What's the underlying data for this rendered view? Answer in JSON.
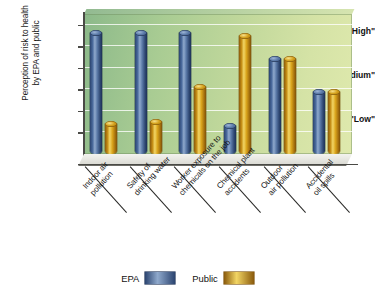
{
  "chart_data": {
    "type": "bar",
    "title": "",
    "xlabel": "",
    "ylabel": "Perception of risk to health by EPA and public",
    "ylabel_line1": "Perception of risk to health",
    "ylabel_line2": "by EPA and public",
    "categories": [
      "Indoor air pollution",
      "Safety of drinking water",
      "Worker exposure to chemicals on the job",
      "Chemical plant accidents",
      "Outdoor air pollution",
      "Accidental oil spills"
    ],
    "category_lines": [
      [
        "Indoor air",
        "pollution"
      ],
      [
        "Safety of",
        "drinking water"
      ],
      [
        "Worker exposure to",
        "chemicals on the job"
      ],
      [
        "Chemical plant",
        "accidents"
      ],
      [
        "Outdoor",
        "air pollution"
      ],
      [
        "Accidental",
        "oil spills"
      ]
    ],
    "series": [
      {
        "name": "EPA",
        "color": "#3c5c8c",
        "values": [
          2.8,
          2.8,
          2.8,
          0.65,
          2.2,
          1.45
        ]
      },
      {
        "name": "Public",
        "color": "#d4a11c",
        "values": [
          0.7,
          0.75,
          1.55,
          2.75,
          2.2,
          1.45
        ]
      }
    ],
    "ytick_labels": [
      "\"Low\"",
      "\"Medium\"",
      "\"High\""
    ],
    "ytick_values": [
      1,
      2,
      3
    ],
    "ylim": [
      0,
      3.25
    ],
    "grid": true,
    "legend_position": "bottom",
    "plot_background": "#a9cc93"
  },
  "legend": {
    "items": [
      {
        "label": "EPA",
        "swatch": "epa-color-swatch"
      },
      {
        "label": "Public",
        "swatch": "public-color-swatch"
      }
    ]
  }
}
